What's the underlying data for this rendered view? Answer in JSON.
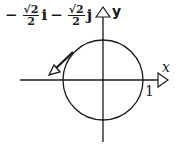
{
  "diagram": {
    "type": "unit-circle-vector",
    "vector_label": {
      "sign1": "−",
      "coef1_num": "√2",
      "coef1_den": "2",
      "unit1": "i",
      "sign2": "−",
      "coef2_num": "√2",
      "coef2_den": "2",
      "unit2": "j"
    },
    "axis_labels": {
      "x": "x",
      "y": "y"
    },
    "tick_label": "1",
    "colors": {
      "stroke": "#1a1a1a",
      "background": "#ffffff"
    }
  }
}
